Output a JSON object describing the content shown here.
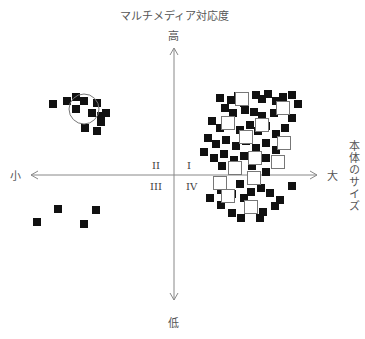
{
  "diagram": {
    "y_axis_title": "マルチメディア対応度",
    "y_high_label": "高",
    "y_low_label": "低",
    "x_axis_title": "本体のサイズ",
    "x_small_label": "小",
    "x_large_label": "大",
    "quadrants": {
      "q1": "I",
      "q2": "II",
      "q3": "III",
      "q4": "IV"
    },
    "colors": {
      "axis": "#888888",
      "marker": "#111111",
      "open_marker_stroke": "#777777",
      "text": "#555555"
    }
  },
  "chart_data": {
    "type": "scatter",
    "title": "",
    "xlabel": "本体のサイズ (小 → 大)",
    "ylabel": "マルチメディア対応度 (低 → 高)",
    "axis_center": [
      174,
      175
    ],
    "grid": false,
    "annotations": [
      {
        "type": "circle",
        "cx": 84,
        "cy": 109,
        "r": 15
      }
    ],
    "series": [
      {
        "name": "filled",
        "marker": "filled-square",
        "points": [
          [
            53,
            104
          ],
          [
            67,
            101
          ],
          [
            76,
            97
          ],
          [
            84,
            101
          ],
          [
            76,
            109
          ],
          [
            97,
            103
          ],
          [
            92,
            113
          ],
          [
            101,
            116
          ],
          [
            106,
            113
          ],
          [
            101,
            122
          ],
          [
            85,
            128
          ],
          [
            97,
            131
          ],
          [
            58,
            209
          ],
          [
            96,
            210
          ],
          [
            37,
            222
          ],
          [
            84,
            224
          ],
          [
            220,
            98
          ],
          [
            231,
            100
          ],
          [
            238,
            96
          ],
          [
            244,
            103
          ],
          [
            256,
            95
          ],
          [
            262,
            99
          ],
          [
            268,
            94
          ],
          [
            276,
            101
          ],
          [
            283,
            97
          ],
          [
            292,
            95
          ],
          [
            298,
            104
          ],
          [
            225,
            108
          ],
          [
            233,
            113
          ],
          [
            245,
            110
          ],
          [
            254,
            112
          ],
          [
            262,
            116
          ],
          [
            274,
            113
          ],
          [
            286,
            110
          ],
          [
            292,
            118
          ],
          [
            212,
            121
          ],
          [
            220,
            128
          ],
          [
            230,
            123
          ],
          [
            240,
            130
          ],
          [
            250,
            125
          ],
          [
            258,
            131
          ],
          [
            266,
            126
          ],
          [
            276,
            134
          ],
          [
            285,
            128
          ],
          [
            208,
            138
          ],
          [
            216,
            144
          ],
          [
            226,
            140
          ],
          [
            236,
            146
          ],
          [
            246,
            141
          ],
          [
            256,
            148
          ],
          [
            266,
            143
          ],
          [
            276,
            150
          ],
          [
            204,
            152
          ],
          [
            214,
            158
          ],
          [
            224,
            154
          ],
          [
            234,
            160
          ],
          [
            244,
            156
          ],
          [
            256,
            161
          ],
          [
            266,
            158
          ],
          [
            276,
            162
          ],
          [
            222,
            166
          ],
          [
            238,
            168
          ],
          [
            252,
            166
          ],
          [
            266,
            172
          ],
          [
            240,
            184
          ],
          [
            221,
            190
          ],
          [
            232,
            194
          ],
          [
            251,
            192
          ],
          [
            261,
            188
          ],
          [
            270,
            193
          ],
          [
            292,
            186
          ],
          [
            210,
            198
          ],
          [
            221,
            205
          ],
          [
            244,
            198
          ],
          [
            252,
            209
          ],
          [
            263,
            212
          ],
          [
            280,
            200
          ],
          [
            275,
            206
          ],
          [
            232,
            213
          ],
          [
            241,
            218
          ],
          [
            260,
            218
          ]
        ]
      },
      {
        "name": "open",
        "marker": "open-square",
        "points": [
          [
            242,
            99
          ],
          [
            283,
            108
          ],
          [
            228,
            123
          ],
          [
            262,
            125
          ],
          [
            246,
            137
          ],
          [
            284,
            143
          ],
          [
            255,
            158
          ],
          [
            235,
            168
          ],
          [
            220,
            183
          ],
          [
            254,
            178
          ],
          [
            228,
            196
          ],
          [
            251,
            207
          ],
          [
            278,
            162
          ]
        ]
      }
    ]
  }
}
